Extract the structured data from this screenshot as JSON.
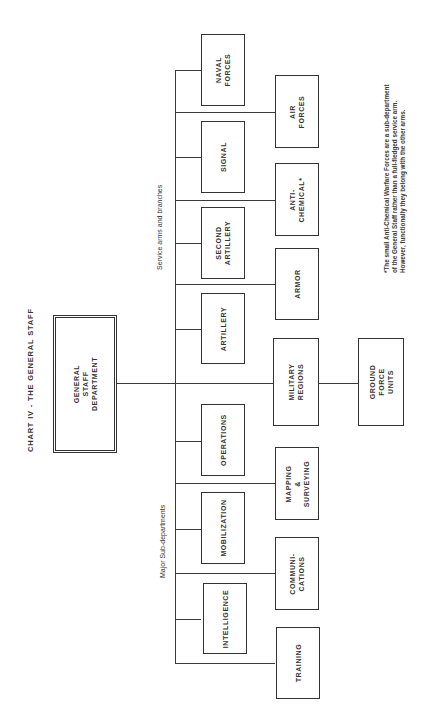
{
  "chart": {
    "title": "CHART IV - THE GENERAL STAFF",
    "root": {
      "label": "GENERAL\nSTAFF\nDEPARTMENT"
    },
    "group_labels": {
      "service_arms": "Service arms and branches",
      "sub_departments": "Major Sub-departments"
    },
    "column1": [
      {
        "id": "naval",
        "label": "NAVAL\nFORCES"
      },
      {
        "id": "signal",
        "label": "SIGNAL"
      },
      {
        "id": "second_artillery",
        "label": "SECOND\nARTILLERY"
      },
      {
        "id": "artillery",
        "label": "ARTILLERY"
      },
      {
        "id": "operations",
        "label": "OPERATIONS"
      },
      {
        "id": "mobilization",
        "label": "MOBILIZATION"
      },
      {
        "id": "intelligence",
        "label": "INTELLIGENCE"
      }
    ],
    "column2": [
      {
        "id": "air",
        "label": "AIR\nFORCES"
      },
      {
        "id": "anti_chemical",
        "label": "ANTI-\nCHEMICAL*"
      },
      {
        "id": "armor",
        "label": "ARMOR"
      },
      {
        "id": "military_regions",
        "label": "MILITARY\nREGIONS"
      },
      {
        "id": "mapping",
        "label": "MAPPING\n&\nSURVEYING"
      },
      {
        "id": "communications",
        "label": "COMMUNI-\nCATIONS"
      },
      {
        "id": "training",
        "label": "TRAINING"
      }
    ],
    "column3": [
      {
        "id": "ground_force_units",
        "label": "GROUND\nFORCE\nUNITS"
      }
    ],
    "footnote": "*The small Anti-Chemical Warfare Forces are a sub-department\nof the General Staff rather than a full-fledged service arm.\nHowever, functionally they belong with the other arms."
  }
}
